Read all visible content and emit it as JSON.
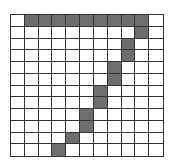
{
  "grid": {
    "columns": 11,
    "rows": 12,
    "fill_color": "#6e6e6e",
    "line_color": "#333333",
    "filled_cells": [
      [
        0,
        1
      ],
      [
        0,
        2
      ],
      [
        0,
        3
      ],
      [
        0,
        4
      ],
      [
        0,
        5
      ],
      [
        0,
        6
      ],
      [
        0,
        7
      ],
      [
        0,
        8
      ],
      [
        0,
        9
      ],
      [
        1,
        9
      ],
      [
        2,
        8
      ],
      [
        3,
        8
      ],
      [
        4,
        7
      ],
      [
        5,
        7
      ],
      [
        6,
        6
      ],
      [
        7,
        6
      ],
      [
        8,
        5
      ],
      [
        9,
        5
      ],
      [
        10,
        4
      ],
      [
        11,
        3
      ]
    ]
  }
}
